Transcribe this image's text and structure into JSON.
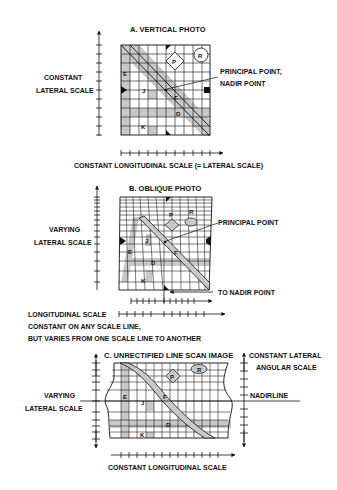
{
  "figure": {
    "panels": [
      {
        "id": "A",
        "title": "A. VERTICAL PHOTO",
        "left_label": [
          "CONSTANT",
          "LATERAL SCALE"
        ],
        "callout": [
          "PRINCIPAL POINT,",
          "NADIR POINT"
        ],
        "bottom_label": "CONSTANT LONGITUDINAL SCALE (= LATERAL SCALE)",
        "features": [
          "E",
          "J",
          "P",
          "R",
          "F",
          "D",
          "K"
        ]
      },
      {
        "id": "B",
        "title": "B.  OBLIQUE PHOTO",
        "left_label": [
          "VARYING",
          "LATERAL SCALE"
        ],
        "callout": [
          "PRINCIPAL POINT"
        ],
        "nadir_label": "TO NADIR POINT",
        "bottom_label": [
          "LONGITUDINAL SCALE",
          "CONSTANT ON ANY SCALE LINE,",
          "BUT VARIES FROM ONE SCALE LINE TO ANOTHER"
        ],
        "features": [
          "P",
          "R",
          "J",
          "E",
          "F",
          "D",
          "K"
        ]
      },
      {
        "id": "C",
        "title": "C. UNRECTIFIED LINE SCAN IMAGE",
        "left_label": [
          "VARYING",
          "LATERAL SCALE"
        ],
        "right_label": [
          "CONSTANT LATERAL",
          "ANGULAR SCALE"
        ],
        "nadirline_label": "NADIRLINE",
        "bottom_label": "CONSTANT LONGITUDINAL SCALE",
        "features": [
          "P",
          "R",
          "E",
          "J",
          "F",
          "D",
          "K"
        ]
      }
    ],
    "colors": {
      "ink": "#111111",
      "shade": "#c8c8c8",
      "background": "#ffffff"
    }
  }
}
